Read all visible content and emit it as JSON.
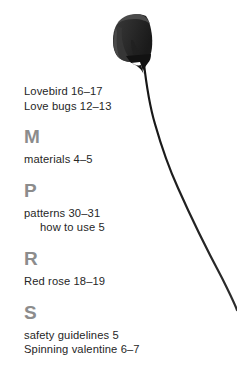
{
  "page": {
    "kind": "book-index-page",
    "background_color": "#ffffff",
    "text_color": "#262626",
    "letter_heading_color": "#8c8c8c",
    "artwork_color": "#2b2b2b"
  },
  "artwork": {
    "name": "calla-lily-flower-silhouette",
    "description": "dark rolled paper flower bloom with long curving stem",
    "bloom_color": "#2e2e2e",
    "bloom_shadow_color": "#141414",
    "stem_color": "#1f1f1f"
  },
  "index": {
    "continued_entries": [
      {
        "label": "Lovebird 16–17"
      },
      {
        "label": "Love bugs 12–13"
      }
    ],
    "groups": [
      {
        "letter": "M",
        "entries": [
          {
            "label": "materials 4–5",
            "sub": false
          }
        ]
      },
      {
        "letter": "P",
        "entries": [
          {
            "label": "patterns 30–31",
            "sub": false
          },
          {
            "label": "how to use 5",
            "sub": true
          }
        ]
      },
      {
        "letter": "R",
        "entries": [
          {
            "label": "Red rose 18–19",
            "sub": false
          }
        ]
      },
      {
        "letter": "S",
        "entries": [
          {
            "label": "safety guidelines 5",
            "sub": false
          },
          {
            "label": "Spinning valentine 6–7",
            "sub": false
          }
        ]
      }
    ]
  }
}
